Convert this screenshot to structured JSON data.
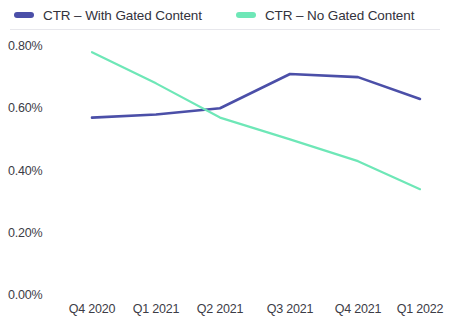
{
  "legend": {
    "position": "top-left",
    "items": [
      {
        "label": "CTR – With Gated Content",
        "color": "#4b4fa8",
        "icon": "line-swatch-icon"
      },
      {
        "label": "CTR – No Gated Content",
        "color": "#6ee7b7",
        "icon": "line-swatch-icon"
      }
    ]
  },
  "axes": {
    "y_ticks": [
      "0.80%",
      "0.60%",
      "0.40%",
      "0.20%",
      "0.00%"
    ],
    "x_ticks": [
      "Q4 2020",
      "Q1 2021",
      "Q2 2021",
      "Q3 2021",
      "Q4 2021",
      "Q1 2022"
    ]
  },
  "chart_data": {
    "type": "line",
    "title": "",
    "subtitle": "",
    "xlabel": "",
    "ylabel": "",
    "grid": false,
    "legend_position": "top-left",
    "categories": [
      "Q4 2020",
      "Q1 2021",
      "Q2 2021",
      "Q3 2021",
      "Q4 2021",
      "Q1 2022"
    ],
    "ylim": [
      0.0,
      0.8
    ],
    "ytick_values": [
      0.8,
      0.6,
      0.4,
      0.2,
      0.0
    ],
    "ytick_labels": [
      "0.80%",
      "0.60%",
      "0.40%",
      "0.20%",
      "0.00%"
    ],
    "y_unit": "percent",
    "series": [
      {
        "name": "CTR – With Gated Content",
        "color": "#4b4fa8",
        "values": [
          0.57,
          0.58,
          0.6,
          0.71,
          0.7,
          0.63
        ]
      },
      {
        "name": "CTR – No Gated Content",
        "color": "#6ee7b7",
        "values": [
          0.78,
          0.68,
          0.57,
          0.5,
          0.43,
          0.34
        ]
      }
    ]
  }
}
